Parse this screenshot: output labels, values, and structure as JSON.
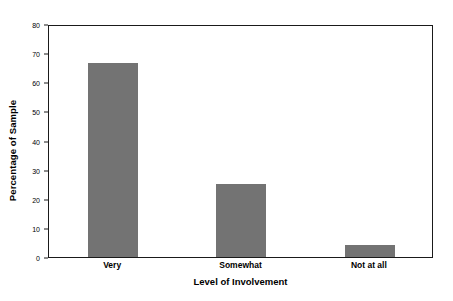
{
  "chart_data": {
    "type": "bar",
    "title": "",
    "subtitle": "",
    "categories": [
      "Very",
      "Somewhat",
      "Not at all"
    ],
    "values": [
      66.5,
      25,
      4
    ],
    "xlabel": "Level of Involvement",
    "ylabel": "Percentage of Sample",
    "ylim": [
      0,
      80
    ],
    "xlim": null,
    "yticks": [
      0,
      10,
      20,
      30,
      40,
      50,
      60,
      70,
      80
    ],
    "ytick_labels": [
      "0",
      "10",
      "20",
      "30",
      "40",
      "50",
      "60",
      "70",
      "80"
    ],
    "grid": false,
    "legend": null,
    "legend_position": "none",
    "annotations": [],
    "colors": {
      "bar_fill": "#737373",
      "axis": "#1a1a1a",
      "text": "#000000",
      "background": "#ffffff"
    }
  }
}
